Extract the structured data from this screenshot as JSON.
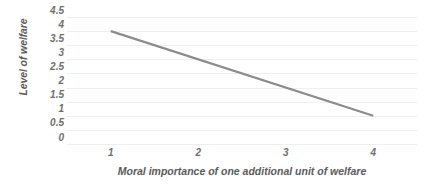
{
  "chart_data": {
    "type": "line",
    "title": "",
    "subtitle": "",
    "xlabel": "Moral importance of one additional unit of welfare",
    "ylabel": "Level of welfare",
    "x": [
      1,
      4
    ],
    "xtick_labels": [
      "1",
      "2",
      "3",
      "4"
    ],
    "xtick_values": [
      1,
      2,
      3,
      4
    ],
    "xlim": [
      0.5,
      4.5
    ],
    "ytick_labels": [
      "4.5",
      "4",
      "3.5",
      "3",
      "2.5",
      "2",
      "1.5",
      "1",
      "0.5",
      "0"
    ],
    "ytick_values": [
      4.5,
      4,
      3.5,
      3,
      2.5,
      2,
      1.5,
      1,
      0.5,
      0
    ],
    "ylim": [
      0,
      4.5
    ],
    "grid": "horizontal",
    "legend": "none",
    "series": [
      {
        "name": "welfare",
        "x": [
          1,
          4
        ],
        "values": [
          4,
          1
        ],
        "color": "#8c8c8c",
        "line_width": 2.2
      }
    ],
    "colors": {
      "line": "#8c8c8c",
      "gridline": "#efefef",
      "tick_text": "#6e6e6e",
      "axis_title_text": "#5a5a5a",
      "background": "#ffffff"
    }
  }
}
